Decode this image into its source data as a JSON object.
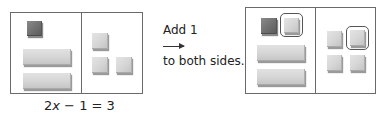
{
  "figure_left": {
    "equation": {
      "coef": "2",
      "variable": "x",
      "rest": " − 1 = 3"
    },
    "left_side": {
      "x_bars": 2,
      "negative_units": 1
    },
    "right_side": {
      "positive_units": 3
    }
  },
  "transition": {
    "line1": "Add 1",
    "line2": "to both sides.",
    "arrow": "right-arrow"
  },
  "figure_right": {
    "left_side": {
      "x_bars": 2,
      "negative_units": 1,
      "added_positive_units": 1
    },
    "right_side": {
      "positive_units": 3,
      "added_positive_units": 1
    }
  },
  "colors": {
    "positive_tile": "#d6d6d6",
    "negative_tile": "#6e6e6e",
    "border": "#6a6a6a",
    "highlight_ring": "#555555"
  }
}
